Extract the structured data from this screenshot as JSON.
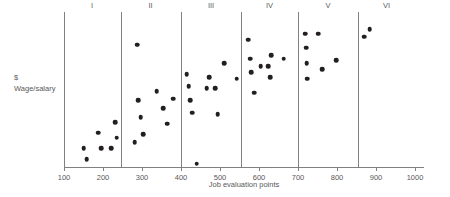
{
  "chart_data": {
    "type": "scatter",
    "title": "",
    "xlabel": "Job evaluation points",
    "ylabel": "$ Wage/salary",
    "ylabel_lines": [
      "$",
      "Wage/salary"
    ],
    "xlim": [
      100,
      1000
    ],
    "ylim": [
      0,
      100
    ],
    "grid": false,
    "legend": null,
    "x_ticks": [
      100,
      200,
      300,
      400,
      500,
      600,
      700,
      800,
      900,
      1000
    ],
    "x_tick_labels": [
      "100",
      "200",
      "300",
      "400",
      "500",
      "600",
      "700",
      "800",
      "900",
      "1000"
    ],
    "y_ticks": [],
    "y_tick_labels": [],
    "grade_boundaries": [
      245,
      400,
      555,
      700,
      855
    ],
    "grades": [
      {
        "label": "I",
        "center": 172,
        "from": 100,
        "to": 245
      },
      {
        "label": "II",
        "center": 322,
        "from": 245,
        "to": 400
      },
      {
        "label": "III",
        "center": 477,
        "from": 400,
        "to": 555
      },
      {
        "label": "IV",
        "center": 627,
        "from": 555,
        "to": 700
      },
      {
        "label": "V",
        "center": 777,
        "from": 700,
        "to": 855
      },
      {
        "label": "VI",
        "center": 927,
        "from": 855,
        "to": 1000
      }
    ],
    "series": [
      {
        "name": "Jobs",
        "marker": "circle",
        "color": "#231f20",
        "points": [
          {
            "x": 150,
            "y": 12
          },
          {
            "x": 158,
            "y": 5
          },
          {
            "x": 188,
            "y": 22
          },
          {
            "x": 196,
            "y": 12
          },
          {
            "x": 221,
            "y": 12
          },
          {
            "x": 232,
            "y": 29
          },
          {
            "x": 235,
            "y": 19
          },
          {
            "x": 281,
            "y": 16
          },
          {
            "x": 288,
            "y": 79
          },
          {
            "x": 290,
            "y": 43
          },
          {
            "x": 297,
            "y": 32
          },
          {
            "x": 303,
            "y": 21
          },
          {
            "x": 338,
            "y": 49
          },
          {
            "x": 355,
            "y": 38
          },
          {
            "x": 364,
            "y": 28
          },
          {
            "x": 380,
            "y": 44
          },
          {
            "x": 415,
            "y": 60
          },
          {
            "x": 420,
            "y": 52
          },
          {
            "x": 423,
            "y": 43
          },
          {
            "x": 428,
            "y": 35
          },
          {
            "x": 440,
            "y": 2
          },
          {
            "x": 466,
            "y": 51
          },
          {
            "x": 472,
            "y": 58
          },
          {
            "x": 488,
            "y": 51
          },
          {
            "x": 494,
            "y": 34
          },
          {
            "x": 511,
            "y": 67
          },
          {
            "x": 543,
            "y": 57
          },
          {
            "x": 572,
            "y": 82
          },
          {
            "x": 578,
            "y": 70
          },
          {
            "x": 580,
            "y": 61
          },
          {
            "x": 587,
            "y": 48
          },
          {
            "x": 604,
            "y": 65
          },
          {
            "x": 623,
            "y": 65
          },
          {
            "x": 628,
            "y": 58
          },
          {
            "x": 632,
            "y": 72
          },
          {
            "x": 663,
            "y": 70
          },
          {
            "x": 718,
            "y": 86
          },
          {
            "x": 721,
            "y": 77
          },
          {
            "x": 722,
            "y": 67
          },
          {
            "x": 723,
            "y": 57
          },
          {
            "x": 752,
            "y": 86
          },
          {
            "x": 762,
            "y": 63
          },
          {
            "x": 798,
            "y": 69
          },
          {
            "x": 869,
            "y": 84
          },
          {
            "x": 884,
            "y": 89
          }
        ]
      }
    ]
  }
}
